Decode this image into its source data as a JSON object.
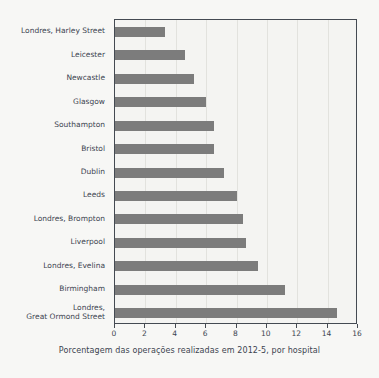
{
  "chart_data": {
    "type": "bar",
    "orientation": "horizontal",
    "title": "",
    "subtitle": "",
    "xlabel": "Porcentagem das operações realizadas em 2012-5, por hospital",
    "ylabel": "",
    "xlim": [
      0,
      16
    ],
    "ylim": null,
    "grid": true,
    "legend": null,
    "xticks": [
      0,
      2,
      4,
      6,
      8,
      10,
      12,
      14,
      16
    ],
    "xticklabels": [
      "0",
      "2",
      "4",
      "6",
      "8",
      "10",
      "12",
      "14",
      "16"
    ],
    "bar_color": "#7c7c7c",
    "background_color": "#f7f7f5",
    "plot_background_color": "#f4f4f2",
    "axis_color": "#444a52",
    "text_color": "#3c4450",
    "categories": [
      "Londres, Harley Street",
      "Leicester",
      "Newcastle",
      "Glasgow",
      "Southampton",
      "Bristol",
      "Dublin",
      "Leeds",
      "Londres, Brompton",
      "Liverpool",
      "Londres, Evelina",
      "Birmingham",
      "Londres,\nGreat Ormond Street"
    ],
    "values": [
      3.3,
      4.6,
      5.2,
      6.0,
      6.5,
      6.5,
      7.2,
      8.0,
      8.4,
      8.6,
      9.4,
      11.2,
      14.6
    ],
    "series": [
      {
        "name": "Porcentagem das operações",
        "values": [
          3.3,
          4.6,
          5.2,
          6.0,
          6.5,
          6.5,
          7.2,
          8.0,
          8.4,
          8.6,
          9.4,
          11.2,
          14.6
        ]
      }
    ]
  }
}
